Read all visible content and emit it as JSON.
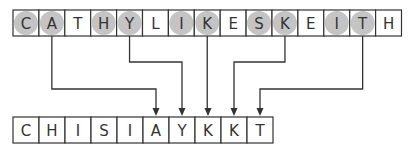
{
  "top_row": {
    "letters": [
      "C",
      "A",
      "T",
      "H",
      "Y",
      "L",
      "I",
      "K",
      "E",
      "S",
      "K",
      "E",
      "I",
      "T",
      "H"
    ],
    "highlighted": [
      true,
      true,
      false,
      true,
      true,
      false,
      true,
      true,
      false,
      true,
      true,
      false,
      true,
      true,
      false
    ]
  },
  "bottom_row": {
    "letters": [
      "C",
      "H",
      "I",
      "S",
      "I",
      "A",
      "Y",
      "K",
      "K",
      "T"
    ]
  },
  "connections": [
    {
      "from": 1,
      "to": 5,
      "elbow_y": 89
    },
    {
      "from": 4,
      "to": 6,
      "elbow_y": 62
    },
    {
      "from": 7,
      "to": 7,
      "elbow_y": null
    },
    {
      "from": 10,
      "to": 8,
      "elbow_y": 62
    },
    {
      "from": 13,
      "to": 9,
      "elbow_y": 89
    }
  ],
  "colors": {
    "highlight": "#c4c4c4",
    "line": "#333333",
    "cell_border": "#333333"
  }
}
